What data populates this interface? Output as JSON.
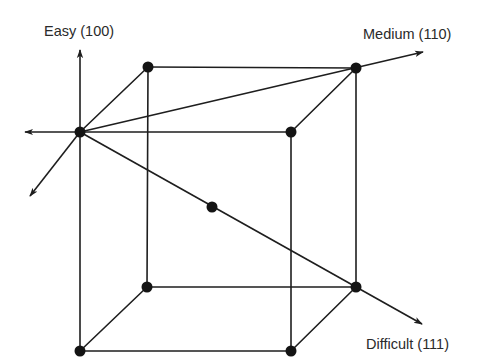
{
  "diagram": {
    "type": "cube-vertex-diagram",
    "labels": {
      "easy": "Easy (100)",
      "medium": "Medium (110)",
      "difficult": "Difficult (111)"
    },
    "colors": {
      "line": "#1e1e1e",
      "node": "#141414",
      "text": "#2a2a2a",
      "background": "#ffffff"
    },
    "nodes": [
      {
        "id": "front-top-left",
        "x": 80,
        "y": 132
      },
      {
        "id": "back-top-left",
        "x": 148,
        "y": 67
      },
      {
        "id": "back-top-right",
        "x": 356,
        "y": 68
      },
      {
        "id": "front-top-right",
        "x": 291,
        "y": 132
      },
      {
        "id": "back-bottom-left",
        "x": 147,
        "y": 287
      },
      {
        "id": "back-bottom-right",
        "x": 356,
        "y": 287
      },
      {
        "id": "front-bottom-left",
        "x": 80,
        "y": 351
      },
      {
        "id": "front-bottom-right",
        "x": 291,
        "y": 351
      },
      {
        "id": "center",
        "x": 212,
        "y": 207
      }
    ],
    "axes": [
      {
        "id": "easy-axis",
        "label_key": "easy",
        "direction": "up"
      },
      {
        "id": "left-axis",
        "direction": "left"
      },
      {
        "id": "down-left-axis",
        "direction": "down-left"
      },
      {
        "id": "medium-axis",
        "label_key": "medium",
        "direction": "up-right"
      },
      {
        "id": "difficult-axis",
        "label_key": "difficult",
        "direction": "down-right"
      }
    ]
  }
}
